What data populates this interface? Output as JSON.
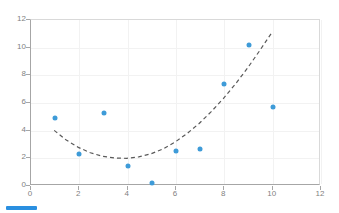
{
  "chart_data": {
    "type": "scatter",
    "title": "",
    "xlabel": "",
    "ylabel": "",
    "xlim": [
      0,
      12
    ],
    "ylim": [
      0,
      12
    ],
    "xticks": [
      0,
      2,
      4,
      6,
      8,
      10,
      12
    ],
    "yticks": [
      0,
      2,
      4,
      6,
      8,
      10,
      12
    ],
    "grid": true,
    "legend_position": "bottom-left",
    "series": [
      {
        "name": "Series 1",
        "marker_color": "#3e9bd8",
        "x": [
          1,
          2,
          3,
          4,
          5,
          6,
          7,
          8,
          9,
          10
        ],
        "values": [
          4.9,
          2.3,
          5.25,
          1.45,
          0.2,
          2.5,
          2.65,
          7.35,
          10.2,
          5.7
        ]
      }
    ],
    "trendline": {
      "name": "Poly. (Series 1)",
      "type": "polynomial-order-2",
      "style": "dashed",
      "color": "#595959",
      "x_range": [
        1,
        10
      ],
      "x": [
        1.0,
        1.5,
        2.0,
        2.5,
        3.0,
        3.5,
        4.0,
        4.5,
        5.0,
        5.5,
        6.0,
        6.5,
        7.0,
        7.5,
        8.0,
        8.5,
        9.0,
        9.5,
        10.0
      ],
      "y": [
        3.95,
        3.25,
        2.72,
        2.33,
        2.08,
        1.95,
        1.93,
        2.03,
        2.25,
        2.6,
        3.1,
        3.72,
        4.45,
        5.3,
        6.25,
        7.3,
        8.45,
        9.7,
        11.0
      ]
    }
  },
  "axes": {
    "y_labels": [
      "12",
      "10",
      "8",
      "6",
      "4",
      "2",
      "0"
    ],
    "x_labels": [
      "0",
      "2",
      "4",
      "6",
      "8",
      "10",
      "12"
    ]
  },
  "legend": {
    "series_label": "",
    "swatch_color": "#2a8fe0"
  },
  "colors": {
    "marker": "#3e9bd8",
    "trendline": "#595959",
    "gridline": "#f2f2f2",
    "axis": "#a6a6a6",
    "tick_text": "#7f7f7f",
    "background": "#ffffff"
  }
}
